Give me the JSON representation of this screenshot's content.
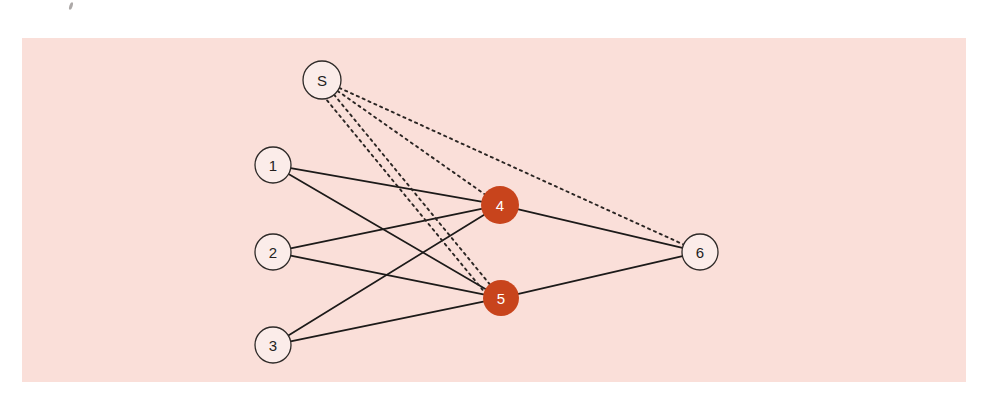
{
  "figure": {
    "title": "",
    "background_color": "#ffffff",
    "panel_color": "#fadfd9",
    "panel": {
      "x": 22,
      "y": 38,
      "width": 944,
      "height": 344
    }
  },
  "colors": {
    "node_fill_open": "#fbece9",
    "node_stroke_open": "#2e2a28",
    "node_fill_highlight": "#c8441c",
    "node_label_dark": "#231f1e",
    "node_label_light": "#ffffff",
    "edge_solid": "#1c1a19",
    "edge_dotted": "#2a2523"
  },
  "graph": {
    "nodes": [
      {
        "id": "S",
        "label": "S",
        "x": 322,
        "y": 80,
        "r": 19,
        "style": "open",
        "name": "node-s"
      },
      {
        "id": "1",
        "label": "1",
        "x": 273,
        "y": 165,
        "r": 18,
        "style": "open",
        "name": "node-1"
      },
      {
        "id": "2",
        "label": "2",
        "x": 273,
        "y": 252,
        "r": 18,
        "style": "open",
        "name": "node-2"
      },
      {
        "id": "3",
        "label": "3",
        "x": 273,
        "y": 345,
        "r": 18,
        "style": "open",
        "name": "node-3"
      },
      {
        "id": "4",
        "label": "4",
        "x": 500,
        "y": 205,
        "r": 19,
        "style": "highlight",
        "name": "node-4"
      },
      {
        "id": "5",
        "label": "5",
        "x": 501,
        "y": 298,
        "r": 18,
        "style": "highlight",
        "name": "node-5"
      },
      {
        "id": "6",
        "label": "6",
        "x": 700,
        "y": 252,
        "r": 18,
        "style": "open",
        "name": "node-6"
      }
    ],
    "edges": [
      {
        "from": "1",
        "to": "4",
        "style": "solid",
        "name": "edge-1-4"
      },
      {
        "from": "1",
        "to": "5",
        "style": "solid",
        "name": "edge-1-5"
      },
      {
        "from": "2",
        "to": "4",
        "style": "solid",
        "name": "edge-2-4"
      },
      {
        "from": "2",
        "to": "5",
        "style": "solid",
        "name": "edge-2-5"
      },
      {
        "from": "3",
        "to": "4",
        "style": "solid",
        "name": "edge-3-4"
      },
      {
        "from": "3",
        "to": "5",
        "style": "solid",
        "name": "edge-3-5"
      },
      {
        "from": "4",
        "to": "6",
        "style": "solid",
        "name": "edge-4-6"
      },
      {
        "from": "5",
        "to": "6",
        "style": "solid",
        "name": "edge-5-6"
      },
      {
        "from": "S",
        "to": "6",
        "style": "dotted",
        "name": "edge-s-6"
      },
      {
        "from": "S",
        "to": "4",
        "style": "dotted",
        "name": "edge-s-4"
      },
      {
        "from": "S",
        "to": "5",
        "style": "dotted",
        "name": "edge-s-5"
      },
      {
        "from": "S",
        "to": "5",
        "style": "dotted",
        "offset": 9,
        "name": "edge-s-5-alt"
      }
    ],
    "marks": [
      {
        "x": 71,
        "y": 6,
        "name": "stray-speck-mark"
      }
    ]
  }
}
